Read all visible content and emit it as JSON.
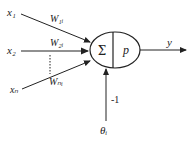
{
  "diagram": {
    "title": "",
    "type": "neuron-model",
    "inputs": [
      {
        "label": "x₁",
        "weight": "W₁ᵢ"
      },
      {
        "label": "x₂",
        "weight": "W₂ᵢ"
      },
      {
        "label": "xₙ",
        "weight": "Wₙᵢ"
      }
    ],
    "neuron": {
      "sum_symbol": "Σ",
      "activation": "p"
    },
    "output": {
      "label": "y"
    },
    "bias": {
      "value": "-1",
      "threshold": "θᵢ"
    },
    "colors": {
      "stroke": "#222222",
      "background": "#ffffff"
    }
  }
}
